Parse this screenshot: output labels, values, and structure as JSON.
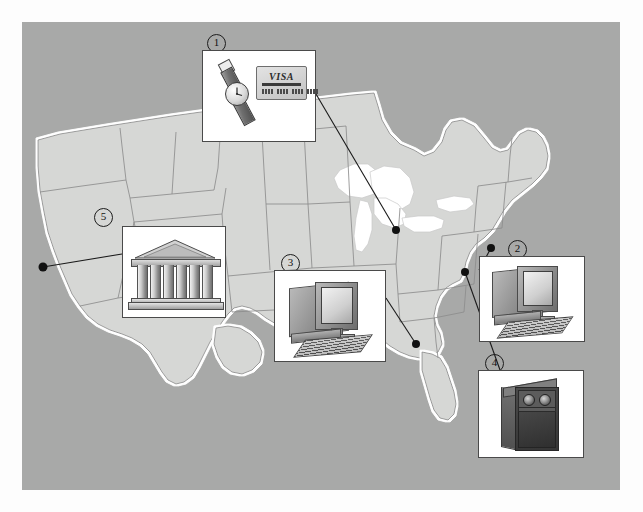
{
  "figure": {
    "canvas_background_color": "#a8a9a8",
    "page_background_color": "#ffffff",
    "land_color": "#d6d7d5",
    "coastline_halo_color": "#ffffff",
    "state_border_color": "#8d8d8d",
    "lake_color": "#ffffff",
    "leader_line_color": "#1a1a1a",
    "marker_dot_color": "#111111"
  },
  "callouts": [
    {
      "id": "1",
      "number": "①",
      "label": "1",
      "icon": "wristwatch-and-credit-card",
      "card_text": "VISA",
      "digit_groups": 4,
      "digits_per_group": 4,
      "box": {
        "x": 180,
        "y": 28,
        "w": 114,
        "h": 92
      },
      "marker": {
        "x": 185,
        "y": 12
      },
      "dot": {
        "x": 374,
        "y": 208
      },
      "region": "Michigan"
    },
    {
      "id": "2",
      "number": "②",
      "label": "2",
      "icon": "desktop-computer",
      "box": {
        "x": 457,
        "y": 234,
        "w": 106,
        "h": 86
      },
      "marker": {
        "x": 486,
        "y": 218
      },
      "dot": {
        "x": 469,
        "y": 226
      },
      "region": "New Jersey / New York"
    },
    {
      "id": "3",
      "number": "③",
      "label": "3",
      "icon": "desktop-computer",
      "box": {
        "x": 252,
        "y": 248,
        "w": 112,
        "h": 92
      },
      "marker": {
        "x": 259,
        "y": 232
      },
      "dot": {
        "x": 394,
        "y": 322
      },
      "region": "Alabama / Georgia"
    },
    {
      "id": "4",
      "number": "④",
      "label": "4",
      "icon": "server-tower",
      "box": {
        "x": 456,
        "y": 348,
        "w": 106,
        "h": 88
      },
      "marker": {
        "x": 463,
        "y": 332
      },
      "dot": {
        "x": 443,
        "y": 250
      },
      "region": "Virginia"
    },
    {
      "id": "5",
      "number": "⑤",
      "label": "5",
      "icon": "bank-classical-building",
      "columns": 6,
      "box": {
        "x": 100,
        "y": 204,
        "w": 104,
        "h": 92
      },
      "marker": {
        "x": 72,
        "y": 186
      },
      "dot": {
        "x": 21,
        "y": 245
      },
      "region": "Northern California coast"
    }
  ]
}
